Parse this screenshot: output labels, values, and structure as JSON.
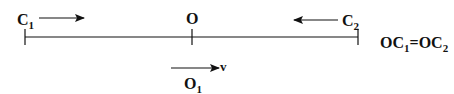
{
  "diagram": {
    "colors": {
      "stroke": "#111111",
      "background": "#ffffff"
    },
    "line": {
      "x1": 25,
      "x2": 358,
      "y": 37
    },
    "points": [
      {
        "id": "C1",
        "label": "C",
        "subscript": "1",
        "tick_x": 25,
        "arrow_direction": "right"
      },
      {
        "id": "O",
        "label": "O",
        "subscript": "",
        "tick_x": 192,
        "arrow_direction": "none"
      },
      {
        "id": "C2",
        "label": "C",
        "subscript": "2",
        "tick_x": 358,
        "arrow_direction": "left"
      }
    ],
    "moving_point": {
      "label": "O",
      "subscript": "1",
      "velocity_label": "v",
      "arrow_direction": "right"
    },
    "equation": {
      "left_base": "OC",
      "left_sub": "1",
      "equals": "=",
      "right_base": "OC",
      "right_sub": "2"
    }
  }
}
